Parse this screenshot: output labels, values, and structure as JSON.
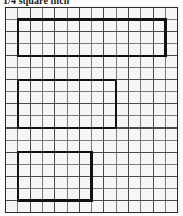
{
  "title": {
    "text": "1/4 square inch"
  },
  "grid": {
    "columns": 14,
    "rows": 17,
    "cell_width": 12.3,
    "cell_height": 12.05,
    "origin_x": 1.5,
    "origin_y": 1.5,
    "line_color": "#4a4a4a",
    "border_color": "#2b2b2b",
    "paper_color": "#f7f7f5",
    "highlight_color": "#111111"
  },
  "highlighted_regions": [
    {
      "name": "region-top",
      "col_start": 1,
      "col_end": 13,
      "row_start": 1,
      "row_end": 4,
      "width_cells": 12,
      "height_cells": 3,
      "area_cells": 36
    },
    {
      "name": "region-middle",
      "col_start": 1,
      "col_end": 9,
      "row_start": 6,
      "row_end": 10,
      "width_cells": 8,
      "height_cells": 4,
      "area_cells": 32
    },
    {
      "name": "region-bottom",
      "col_start": 1,
      "col_end": 7,
      "row_start": 12,
      "row_end": 16,
      "width_cells": 6,
      "height_cells": 4,
      "area_cells": 24
    }
  ]
}
